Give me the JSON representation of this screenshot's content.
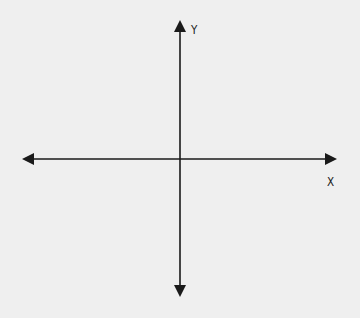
{
  "diagram": {
    "type": "cartesian-axes",
    "background": "#efefef",
    "stroke_color": "#1a1a1a",
    "origin": {
      "x": 180,
      "y": 159
    },
    "x_axis": {
      "label": "X",
      "from": {
        "x": 22,
        "y": 159
      },
      "to": {
        "x": 337,
        "y": 159
      },
      "arrows": "both"
    },
    "y_axis": {
      "label": "Y",
      "from": {
        "x": 180,
        "y": 297
      },
      "to": {
        "x": 180,
        "y": 20
      },
      "arrows": "both"
    }
  }
}
